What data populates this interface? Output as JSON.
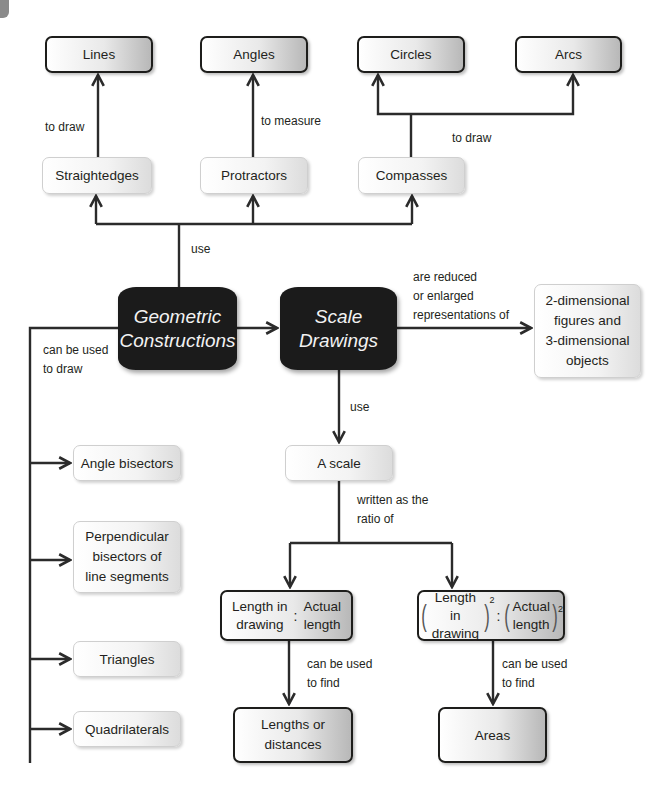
{
  "diagram": {
    "top_targets": [
      {
        "id": "lines",
        "label": "Lines"
      },
      {
        "id": "angles",
        "label": "Angles"
      },
      {
        "id": "circles",
        "label": "Circles"
      },
      {
        "id": "arcs",
        "label": "Arcs"
      }
    ],
    "tools": [
      {
        "id": "straightedges",
        "label": "Straightedges"
      },
      {
        "id": "protractors",
        "label": "Protractors"
      },
      {
        "id": "compasses",
        "label": "Compasses"
      }
    ],
    "core": {
      "geometric": {
        "line1": "Geometric",
        "line2": "Constructions"
      },
      "scale": {
        "line1": "Scale",
        "line2": "Drawings"
      }
    },
    "represent_target": {
      "lines": [
        "2-dimensional",
        "figures and",
        "3-dimensional",
        "objects"
      ]
    },
    "constructs": [
      {
        "id": "angle-bisectors",
        "lines": [
          "Angle bisectors"
        ]
      },
      {
        "id": "perpendicular-bisectors",
        "lines": [
          "Perpendicular",
          "bisectors of",
          "line segments"
        ]
      },
      {
        "id": "triangles",
        "lines": [
          "Triangles"
        ]
      },
      {
        "id": "quadrilaterals",
        "lines": [
          "Quadrilaterals"
        ]
      }
    ],
    "scale_box": {
      "label": "A scale"
    },
    "ratio_linear": {
      "left": [
        "Length in",
        "drawing"
      ],
      "colon": ":",
      "right": [
        "Actual",
        "length"
      ]
    },
    "ratio_squared": {
      "left": [
        "Length in",
        "drawing"
      ],
      "colon": ":",
      "right": [
        "Actual",
        "length"
      ],
      "exponent": "2"
    },
    "results": [
      {
        "id": "lengths",
        "lines": [
          "Lengths or",
          "distances"
        ]
      },
      {
        "id": "areas",
        "lines": [
          "Areas"
        ]
      }
    ],
    "edge_labels": {
      "to_draw_lines": "to draw",
      "to_measure": "to measure",
      "to_draw_circles": "to draw",
      "use_tools": "use",
      "represent": [
        "are reduced",
        "or enlarged",
        "representations of"
      ],
      "can_draw": [
        "can be used",
        "to draw"
      ],
      "use_scale": "use",
      "written_as": [
        "written as the",
        "ratio of"
      ],
      "find_lengths": [
        "can be used",
        "to find"
      ],
      "find_areas": [
        "can be used",
        "to find"
      ]
    },
    "colors": {
      "line": "#2b2b2b",
      "core_fill": "#1b1b1b",
      "core_text": "#f2f2f2",
      "text": "#231f20"
    }
  }
}
